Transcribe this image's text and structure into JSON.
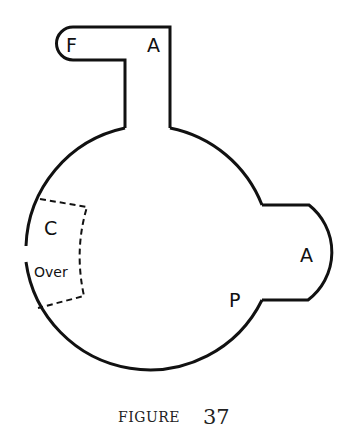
{
  "diagram": {
    "labels": {
      "F": "F",
      "A_top": "A",
      "C": "C",
      "Over": "Over",
      "A_right": "A",
      "P": "P"
    },
    "caption": {
      "word": "FIGURE",
      "number": "37"
    },
    "stroke_color": "#111111"
  }
}
